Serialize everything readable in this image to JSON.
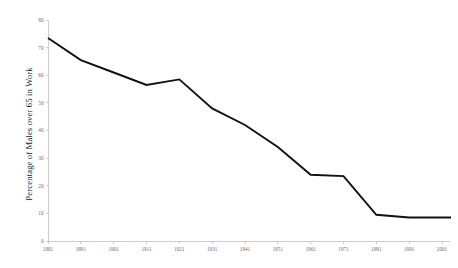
{
  "chart_data": {
    "type": "line",
    "title": "",
    "xlabel": "",
    "ylabel": "Percentage of Males over 65 in Work",
    "categories": [
      "1881",
      "1891",
      "1901",
      "1911",
      "1921",
      "1931",
      "1941",
      "1951",
      "1961",
      "1971",
      "1981",
      "1991",
      "2001"
    ],
    "x": [
      1881,
      1891,
      1901,
      1911,
      1921,
      1931,
      1941,
      1951,
      1961,
      1971,
      1981,
      1991,
      2001
    ],
    "values": [
      73.5,
      65.5,
      61.0,
      56.5,
      58.5,
      48.0,
      42.0,
      34.0,
      24.0,
      23.5,
      9.5,
      8.5,
      8.5
    ],
    "series": [
      {
        "name": "Percentage of Males over 65 in Work",
        "values": [
          73.5,
          65.5,
          61.0,
          56.5,
          58.5,
          48.0,
          42.0,
          34.0,
          24.0,
          23.5,
          9.5,
          8.5,
          8.5
        ],
        "color": "#111111"
      }
    ],
    "ylim": [
      0,
      80
    ],
    "yticks": [
      0,
      10,
      20,
      30,
      40,
      50,
      60,
      70,
      80
    ],
    "ytick_labels": [
      "0",
      "10",
      "20",
      "30",
      "40",
      "50",
      "60",
      "70",
      "80"
    ],
    "xlim": [
      1881,
      2004
    ],
    "grid": false,
    "legend": null,
    "legend_position": "none",
    "line_extends_past_last_point": true,
    "axis_color": "#b9b9b9",
    "tick_label_color": "#6a6a6a",
    "background_color": "#ffffff"
  }
}
